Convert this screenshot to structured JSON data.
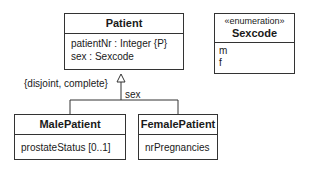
{
  "classes": {
    "patient": {
      "name": "Patient",
      "attributes": [
        "patientNr : Integer  {P}",
        "sex : Sexcode"
      ]
    },
    "sexcode": {
      "stereotype": "«enumeration»",
      "name": "Sexcode",
      "literals": [
        "m",
        "f"
      ]
    },
    "male": {
      "name": "MalePatient",
      "attributes": [
        "prostateStatus [0..1]"
      ]
    },
    "female": {
      "name": "FemalePatient",
      "attributes": [
        "nrPregnancies"
      ]
    }
  },
  "generalization": {
    "constraint": "{disjoint, complete}",
    "discriminator": "sex"
  }
}
